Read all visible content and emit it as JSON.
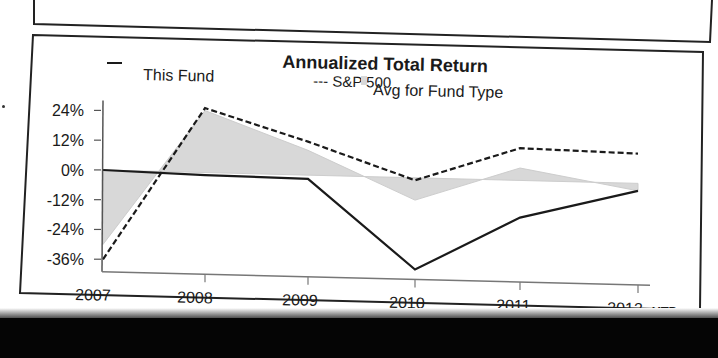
{
  "chart_data": {
    "type": "line",
    "title": "Annualized Total Return",
    "xlabel": "",
    "ylabel": "",
    "categories": [
      "2007",
      "2008",
      "2009",
      "2010",
      "2011",
      "2012"
    ],
    "x_suffix_label": "YTD",
    "y_ticks": [
      "24%",
      "12%",
      "0%",
      "-12%",
      "-24%",
      "-36%"
    ],
    "ylim": [
      -36,
      24
    ],
    "grid": false,
    "legend_position": "top",
    "series": [
      {
        "name": "This Fund",
        "style": "solid",
        "values": [
          0,
          -1,
          -1.5,
          -37,
          -15,
          -3
        ]
      },
      {
        "name": "S&P 500",
        "style": "dashed",
        "values": [
          -36,
          26,
          13.5,
          -1,
          13,
          12
        ]
      },
      {
        "name": "Avg for Fund Type",
        "style": "area",
        "values": [
          -30,
          25,
          10,
          -9,
          5,
          -3
        ]
      }
    ]
  },
  "legend": {
    "this_fund": "This Fund",
    "sp500": "--- S&P 500",
    "avg": "Avg for Fund Type"
  },
  "colors": {
    "line": "#1a1a1a",
    "area_fill": "#d4d4d4",
    "frame": "#222222",
    "background": "#ffffff",
    "bottom_band": "#050505"
  }
}
